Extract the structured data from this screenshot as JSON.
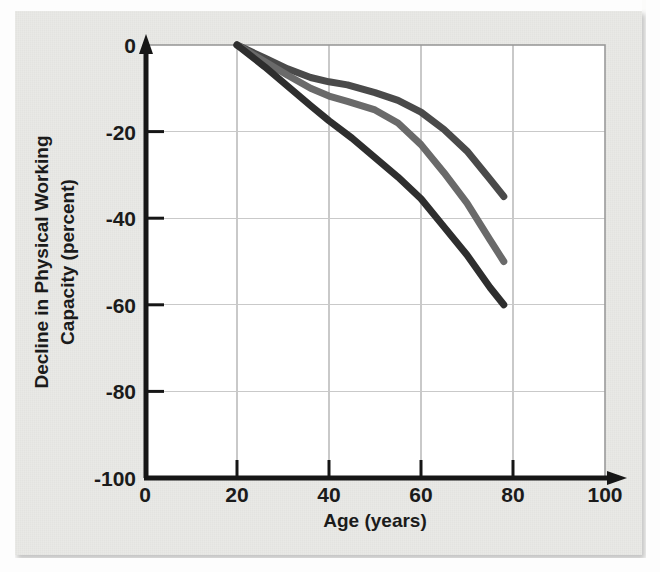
{
  "figure": {
    "background_color": "#e9e9e6",
    "plot_background_color": "#ffffff",
    "grid_color": "#c9c9c9",
    "axis_color": "#161616"
  },
  "chart_data": {
    "type": "line",
    "title": "",
    "xlabel": "Age (years)",
    "ylabel": "Decline in Physical Working Capacity (percent)",
    "ylabel_line1": "Decline in Physical Working",
    "ylabel_line2": "Capacity (percent)",
    "xlim": [
      0,
      100
    ],
    "ylim": [
      -100,
      0
    ],
    "xticks": [
      0,
      20,
      40,
      60,
      80,
      100
    ],
    "yticks": [
      0,
      -20,
      -40,
      -60,
      -80,
      -100
    ],
    "xticklabels": [
      "0",
      "20",
      "40",
      "60",
      "80",
      "100"
    ],
    "yticklabels": [
      "0",
      "-20",
      "-40",
      "-60",
      "-80",
      "-100"
    ],
    "grid": true,
    "legend": "none",
    "series": [
      {
        "name": "upper-curve",
        "color": "#4a4a4a",
        "linewidth": 7,
        "x": [
          20,
          26,
          31,
          36,
          40,
          44,
          50,
          55,
          60,
          65,
          70,
          75,
          78
        ],
        "y": [
          0,
          -3.0,
          -5.5,
          -7.5,
          -8.5,
          -9.2,
          -11.0,
          -12.8,
          -15.5,
          -19.5,
          -24.5,
          -31.0,
          -35.0
        ]
      },
      {
        "name": "middle-curve",
        "color": "#6a6a6a",
        "linewidth": 7,
        "x": [
          20,
          26,
          31,
          36,
          40,
          44,
          50,
          55,
          60,
          65,
          70,
          75,
          78
        ],
        "y": [
          0,
          -3.8,
          -7.0,
          -10.0,
          -11.8,
          -13.0,
          -15.0,
          -18.0,
          -23.0,
          -29.5,
          -36.5,
          -45.0,
          -50.0
        ]
      },
      {
        "name": "lower-curve",
        "color": "#2e2e2e",
        "linewidth": 7,
        "x": [
          20,
          26,
          31,
          36,
          40,
          45,
          50,
          55,
          60,
          65,
          70,
          75,
          78
        ],
        "y": [
          0,
          -5.0,
          -9.5,
          -14.0,
          -17.5,
          -21.5,
          -26.0,
          -30.5,
          -35.5,
          -42.0,
          -48.5,
          -56.0,
          -60.0
        ]
      }
    ]
  },
  "axes": {
    "x_arrow": true,
    "y_arrow": true
  }
}
